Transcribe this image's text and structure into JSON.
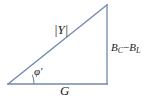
{
  "figure": {
    "kind": "admittance-triangle",
    "background_color": "#ffffff",
    "line_color": "#7189ad",
    "text_color": "#1a1a1a",
    "line_width": 1.2
  },
  "geometry": {
    "origin_vertex": {
      "x": 8,
      "y": 84
    },
    "right_angle_vertex": {
      "x": 107,
      "y": 84
    },
    "apex_vertex": {
      "x": 107,
      "y": 5
    },
    "angle_arc": {
      "center_x": 8,
      "center_y": 84,
      "radius": 26,
      "start_x": 32.3,
      "start_y": 74.6,
      "end_x": 34,
      "end_y": 84
    }
  },
  "labels": {
    "hypotenuse": {
      "name": "admittance-magnitude",
      "text": "|Y|",
      "meaning": "magnitude of admittance"
    },
    "base": {
      "name": "conductance",
      "text": "G",
      "meaning": "conductance"
    },
    "vertical": {
      "name": "net-susceptance",
      "symbol_1": "B",
      "subscript_1": "C",
      "operator": "−",
      "symbol_2": "B",
      "subscript_2": "L",
      "text": "B_C − B_L",
      "meaning": "net susceptance, capacitive minus inductive"
    },
    "angle": {
      "name": "phase-angle",
      "text": "φ′",
      "meaning": "phase angle phi prime"
    }
  }
}
